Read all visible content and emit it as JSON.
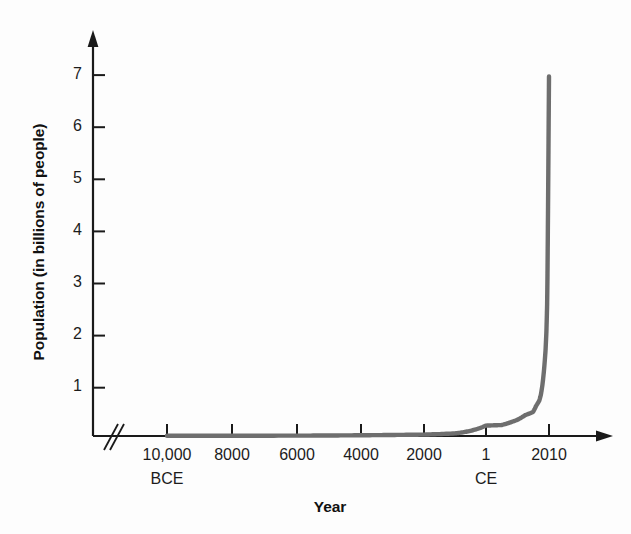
{
  "chart_data": {
    "type": "line",
    "title": "",
    "xlabel": "Year",
    "ylabel": "Population (in billions of people)",
    "ylim": [
      0,
      7.6
    ],
    "yticks": [
      1,
      2,
      3,
      4,
      5,
      6,
      7
    ],
    "ytick_labels": [
      "1",
      "2",
      "3",
      "4",
      "5",
      "6",
      "7"
    ],
    "xticks": [
      -10000,
      -8000,
      -6000,
      -4000,
      -2000,
      1,
      2010
    ],
    "xtick_labels": [
      "10,000",
      "8000",
      "6000",
      "4000",
      "2000",
      "1",
      "2010"
    ],
    "era_labels": [
      {
        "under_tick": "10,000",
        "text": "BCE"
      },
      {
        "under_tick": "1",
        "text": "CE"
      }
    ],
    "grid": false,
    "legend": null,
    "axis_break": true,
    "line_color": "#6e6e6e",
    "axis_color": "#1a1a1a",
    "series": [
      {
        "name": "World population",
        "x": [
          -10000,
          -8000,
          -6000,
          -5000,
          -4000,
          -3000,
          -2000,
          -1000,
          -500,
          1,
          500,
          1000,
          1250,
          1500,
          1600,
          1700,
          1750,
          1800,
          1850,
          1900,
          1927,
          1950,
          1960,
          1974,
          1987,
          1999,
          2010
        ],
        "values": [
          0.004,
          0.005,
          0.007,
          0.01,
          0.014,
          0.02,
          0.027,
          0.05,
          0.1,
          0.2,
          0.21,
          0.31,
          0.4,
          0.46,
          0.58,
          0.68,
          0.79,
          0.98,
          1.26,
          1.65,
          2.0,
          2.52,
          3.0,
          4.0,
          5.0,
          6.0,
          6.9
        ]
      }
    ],
    "annotations": [],
    "peak_value": 6.9,
    "peak_year": 2010
  },
  "labels": {
    "y_axis_title": "Population (in billions of people)",
    "x_axis_title": "Year"
  }
}
